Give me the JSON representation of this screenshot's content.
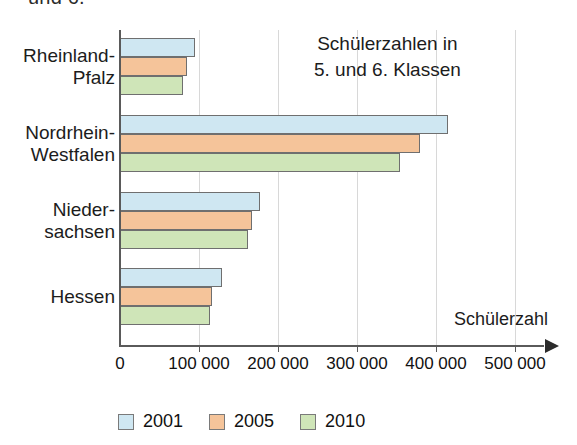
{
  "cut_caption": "und 6.",
  "annotation": "Schülerzahlen in\n5. und 6. Klassen",
  "axis_title": "Schülerzahl",
  "colors": {
    "series_2001": "#cfe7f2",
    "series_2005": "#f5c49a",
    "series_2010": "#cfe5b8",
    "bar_outline": "#6f6f6f",
    "axis": "#5a5a5a",
    "grid": "#d8d8d8"
  },
  "legend": {
    "items": [
      {
        "label": "2001",
        "color": "#cfe7f2"
      },
      {
        "label": "2005",
        "color": "#f5c49a"
      },
      {
        "label": "2010",
        "color": "#cfe5b8"
      }
    ]
  },
  "chart_data": {
    "type": "bar",
    "orientation": "horizontal",
    "title": "Schülerzahlen in 5. und 6. Klassen",
    "xlabel": "Schülerzahl",
    "ylabel": "",
    "xlim": [
      0,
      540000
    ],
    "xticks": [
      0,
      100000,
      200000,
      300000,
      400000,
      500000
    ],
    "xtick_labels": [
      "0",
      "100 000",
      "200 000",
      "300 000",
      "400 000",
      "500 000"
    ],
    "grid": true,
    "legend_position": "bottom",
    "categories": [
      "Rheinland-\nPfalz",
      "Nordrhein-\nWestfalen",
      "Nieder-\nsachsen",
      "Hessen"
    ],
    "series": [
      {
        "name": "2001",
        "color": "#cfe7f2",
        "values": [
          95000,
          415000,
          177000,
          129000
        ]
      },
      {
        "name": "2005",
        "color": "#f5c49a",
        "values": [
          85000,
          380000,
          167000,
          117000
        ]
      },
      {
        "name": "2010",
        "color": "#cfe5b8",
        "values": [
          80000,
          354000,
          162000,
          114000
        ]
      }
    ]
  }
}
